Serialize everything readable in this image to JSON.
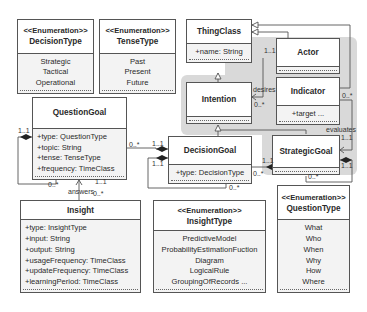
{
  "diagram": {
    "type": "UML class diagram",
    "classes": {
      "decision_type": {
        "stereotype": "<<Enumeration>>",
        "name": "DecisionType",
        "literals": [
          "Strategic",
          "Tactical",
          "Operational"
        ]
      },
      "tense_type": {
        "stereotype": "<<Enumeration>>",
        "name": "TenseType",
        "literals": [
          "Past",
          "Present",
          "Future"
        ]
      },
      "thing_class": {
        "name": "ThingClass",
        "attributes": [
          "+name: String"
        ]
      },
      "actor": {
        "name": "Actor",
        "attributes": []
      },
      "intention": {
        "name": "Intention",
        "attributes": []
      },
      "indicator": {
        "name": "Indicator",
        "attributes": [
          "+target ..."
        ]
      },
      "question_goal": {
        "name": "QuestionGoal",
        "attributes": [
          "+type: QuestionType",
          "+topic: String",
          "+tense: TenseType",
          "+frequency: TimeClass"
        ]
      },
      "decision_goal": {
        "name": "DecisionGoal",
        "attributes": [
          "+type: DecisionType"
        ]
      },
      "strategic_goal": {
        "name": "StrategicGoal",
        "attributes": []
      },
      "insight": {
        "name": "Insight",
        "attributes": [
          "+type: InsightType",
          "+input: String",
          "+output: String",
          "+usageFrequency: TimeClass",
          "+updateFrequency: TimeClass",
          "+learningPeriod: TimeClass"
        ]
      },
      "insight_type": {
        "stereotype": "<<Enumeration>>",
        "name": "InsightType",
        "literals": [
          "PredictiveModel",
          "ProbabilityEstimationFuction",
          "Diagram",
          "LogicalRule",
          "GroupingOfRecords ..."
        ]
      },
      "question_type": {
        "stereotype": "<<Enumeration>>",
        "name": "QuestionType",
        "literals": [
          "What",
          "Who",
          "When",
          "Why",
          "How",
          "Where"
        ]
      }
    },
    "labels": {
      "desires": "desires",
      "evaluates": "evaluates",
      "answers": "answers",
      "actor_desires_mult": "1..1",
      "intention_desires_mult": "0..*",
      "indicator_mult": "0..*",
      "evaluates_mult": "1..1",
      "strategic_self_mult": "1..1",
      "strategic_bottom_mult": "0..*",
      "dg_sg_left_mult": "0..*",
      "dg_sg_right_mult": "1..1",
      "qg_dg_left_mult": "0..*",
      "qg_dg_right_mult": "1..1",
      "dg_self_mult": "1..1",
      "dg_bottom_mult": "0..*",
      "qg_self_mult": "1..1",
      "qg_bottom_mult": "0..*",
      "answers_top_mult": "1..1",
      "answers_bottom_mult": "0..*"
    },
    "colors": {
      "border": "#555555",
      "attribute_bg": "#f3f3f3",
      "package_gray": "#d9d9d9"
    }
  }
}
